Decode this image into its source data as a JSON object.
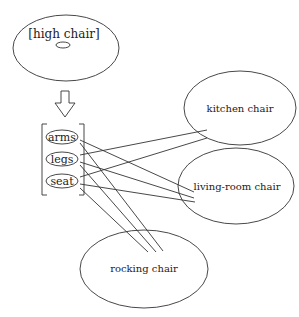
{
  "diagram": {
    "source_node": {
      "label": "[high chair]"
    },
    "features": [
      {
        "id": "arms",
        "label": "arms"
      },
      {
        "id": "legs",
        "label": "legs"
      },
      {
        "id": "seat",
        "label": "seat"
      }
    ],
    "targets": [
      {
        "id": "kitchen",
        "label": "kitchen chair"
      },
      {
        "id": "living",
        "label": "living-room chair"
      },
      {
        "id": "rocking",
        "label": "rocking chair"
      }
    ],
    "edges": [
      {
        "from": "legs",
        "to": "kitchen"
      },
      {
        "from": "seat",
        "to": "kitchen"
      },
      {
        "from": "arms",
        "to": "living"
      },
      {
        "from": "legs",
        "to": "living"
      },
      {
        "from": "seat",
        "to": "living"
      },
      {
        "from": "arms",
        "to": "rocking"
      },
      {
        "from": "legs",
        "to": "rocking"
      },
      {
        "from": "seat",
        "to": "rocking"
      }
    ],
    "colors": {
      "stroke": "#333333",
      "background": "#ffffff"
    }
  }
}
